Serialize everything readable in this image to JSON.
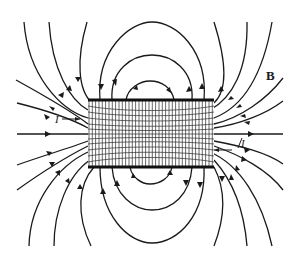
{
  "figure": {
    "labels": {
      "field": "B",
      "current_left": "I",
      "current_right": "I"
    },
    "colors": {
      "line": "#1a1a1a",
      "background": "#ffffff"
    },
    "solenoid": {
      "x": 88,
      "y": 100,
      "width": 126,
      "height": 67,
      "turns": 38
    }
  }
}
